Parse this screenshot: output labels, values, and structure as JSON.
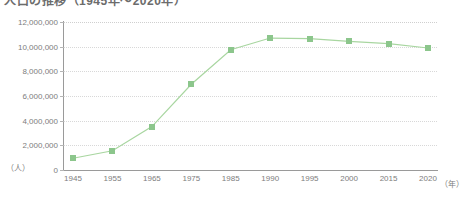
{
  "chart_title": "人口の推移（1945年～2020年）",
  "axis": {
    "y_unit_label": "（人）",
    "x_unit_label": "（年）",
    "y_ticks": [
      "0",
      "2,000,000",
      "4,000,000",
      "6,000,000",
      "8,000,000",
      "10,000,000",
      "12,000,000"
    ],
    "x_ticks": [
      "1945",
      "1955",
      "1965",
      "1975",
      "1985",
      "1990",
      "1995",
      "2000",
      "2015",
      "2020"
    ]
  },
  "colors": {
    "marker": "#8cc68c",
    "line": "#a8d6a0",
    "grid": "#d8d8d8",
    "axis": "#9a9a9a",
    "label_text": "#7d7d7d"
  },
  "chart_data": {
    "type": "line",
    "title": "人口の推移（1945年～2020年）",
    "xlabel": "（年）",
    "ylabel": "（人）",
    "ylim": [
      0,
      12000000
    ],
    "ytick_values": [
      0,
      2000000,
      4000000,
      6000000,
      8000000,
      10000000,
      12000000
    ],
    "ytick_labels": [
      "0",
      "2,000,000",
      "4,000,000",
      "6,000,000",
      "8,000,000",
      "10,000,000",
      "12,000,000"
    ],
    "grid": true,
    "grid_axis": "y",
    "legend": false,
    "marker": "square",
    "categories": [
      "1945",
      "1955",
      "1965",
      "1975",
      "1985",
      "1990",
      "1995",
      "2000",
      "2015",
      "2020"
    ],
    "values": [
      950000,
      1560000,
      3520000,
      6950000,
      9750000,
      10700000,
      10650000,
      10430000,
      10250000,
      9890000
    ],
    "series": [
      {
        "name": "人口",
        "values": [
          950000,
          1560000,
          3520000,
          6950000,
          9750000,
          10700000,
          10650000,
          10430000,
          10250000,
          9890000
        ]
      }
    ]
  }
}
